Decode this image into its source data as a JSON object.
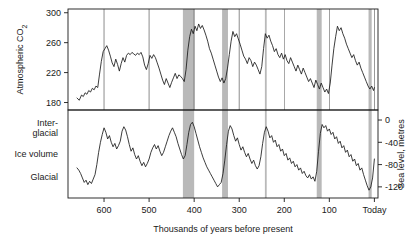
{
  "chart_data": {
    "type": "line",
    "title": "",
    "subtitle": "",
    "xlabel": "Thousands of years before present",
    "xlim": [
      680,
      -8
    ],
    "x_ticks": [
      600,
      500,
      400,
      300,
      200,
      100,
      0
    ],
    "x_tick_labels": [
      "600",
      "500",
      "400",
      "300",
      "200",
      "100",
      "Today"
    ],
    "grid": false,
    "legend": "none",
    "annotations": [
      {
        "label": "interglacial-band",
        "x_start": 425,
        "x_end": 400
      },
      {
        "label": "interglacial-band",
        "x_start": 338,
        "x_end": 325
      },
      {
        "label": "interglacial-band",
        "x_start": 243,
        "x_end": 239
      },
      {
        "label": "interglacial-band",
        "x_start": 128,
        "x_end": 117
      },
      {
        "label": "interglacial-band",
        "x_start": 13,
        "x_end": 6
      }
    ],
    "panels": [
      {
        "name": "co2-panel",
        "ylabel": "Atmospheric CO₂",
        "ylim": [
          170,
          305
        ],
        "y_ticks": [
          300,
          260,
          220,
          180
        ],
        "y_tick_labels": [
          "300",
          "260",
          "220",
          "180"
        ],
        "series": [
          {
            "name": "Atmospheric CO2",
            "color": "#1a1a1a",
            "x": [
              660,
              655,
              650,
              646,
              642,
              638,
              634,
              630,
              626,
              622,
              618,
              614,
              610,
              606,
              602,
              598,
              594,
              590,
              586,
              582,
              578,
              574,
              570,
              566,
              562,
              558,
              554,
              550,
              546,
              542,
              538,
              534,
              530,
              526,
              522,
              518,
              514,
              510,
              506,
              502,
              498,
              494,
              490,
              486,
              482,
              478,
              474,
              470,
              466,
              462,
              458,
              454,
              450,
              446,
              442,
              438,
              434,
              430,
              426,
              422,
              418,
              414,
              410,
              406,
              402,
              398,
              394,
              390,
              386,
              382,
              378,
              374,
              370,
              366,
              362,
              358,
              354,
              350,
              346,
              342,
              338,
              334,
              330,
              326,
              322,
              318,
              314,
              310,
              306,
              302,
              298,
              294,
              290,
              286,
              282,
              278,
              274,
              270,
              266,
              262,
              258,
              254,
              250,
              246,
              242,
              238,
              234,
              230,
              226,
              222,
              218,
              214,
              210,
              206,
              202,
              198,
              194,
              190,
              186,
              182,
              178,
              174,
              170,
              166,
              162,
              158,
              154,
              150,
              146,
              142,
              138,
              134,
              130,
              126,
              122,
              118,
              114,
              110,
              106,
              102,
              98,
              94,
              90,
              86,
              82,
              78,
              74,
              70,
              66,
              62,
              58,
              54,
              50,
              46,
              42,
              38,
              34,
              30,
              26,
              22,
              18,
              14,
              10,
              6,
              2,
              0
            ],
            "y": [
              186,
              183,
              190,
              188,
              193,
              191,
              196,
              194,
              199,
              197,
              202,
              200,
              218,
              235,
              248,
              252,
              256,
              250,
              242,
              233,
              228,
              238,
              231,
              222,
              232,
              240,
              234,
              243,
              246,
              244,
              247,
              245,
              243,
              246,
              244,
              247,
              241,
              230,
              224,
              232,
              243,
              239,
              244,
              240,
              233,
              226,
              218,
              210,
              204,
              212,
              206,
              200,
              207,
              213,
              219,
              212,
              217,
              215,
              212,
              208,
              224,
              250,
              268,
              278,
              272,
              282,
              276,
              285,
              279,
              283,
              277,
              270,
              262,
              252,
              246,
              238,
              230,
              222,
              214,
              208,
              213,
              206,
              212,
              226,
              244,
              262,
              275,
              268,
              272,
              265,
              258,
              250,
              242,
              238,
              232,
              240,
              236,
              228,
              234,
              230,
              224,
              218,
              228,
              252,
              272,
              266,
              270,
              262,
              256,
              248,
              252,
              244,
              240,
              246,
              238,
              244,
              236,
              232,
              240,
              234,
              228,
              222,
              230,
              224,
              218,
              226,
              220,
              214,
              208,
              212,
              206,
              200,
              210,
              204,
              198,
              206,
              200,
              194,
              198,
              192,
              206,
              230,
              252,
              268,
              282,
              276,
              280,
              272,
              266,
              258,
              252,
              246,
              240,
              244,
              236,
              230,
              234,
              226,
              220,
              214,
              208,
              202,
              198,
              202,
              196,
              200,
              194,
              198,
              192,
              188,
              196,
              214,
              240,
              262,
              275
            ]
          }
        ]
      },
      {
        "name": "ice-volume-panel",
        "ylabel": "Ice volume",
        "y_top_label": "Inter-\nglacial",
        "y_top_label_line1": "Inter-",
        "y_top_label_line2": "glacial",
        "y_bottom_label": "Glacial",
        "right_axis_label": "Sea level, metres",
        "right_y_ticks": [
          0,
          -40,
          -80,
          -120
        ],
        "right_y_tick_labels": [
          "0",
          "-40",
          "-80",
          "-120"
        ],
        "ylim": [
          -140,
          18
        ],
        "series": [
          {
            "name": "Ice volume / sea level",
            "color": "#1a1a1a",
            "x": [
              660,
              656,
              652,
              648,
              644,
              640,
              636,
              632,
              628,
              624,
              620,
              616,
              612,
              608,
              604,
              600,
              596,
              592,
              588,
              584,
              580,
              576,
              572,
              568,
              564,
              560,
              556,
              552,
              548,
              544,
              540,
              536,
              532,
              528,
              524,
              520,
              516,
              512,
              508,
              504,
              500,
              496,
              492,
              488,
              484,
              480,
              476,
              472,
              468,
              464,
              460,
              456,
              452,
              448,
              444,
              440,
              436,
              432,
              428,
              424,
              420,
              416,
              412,
              408,
              404,
              400,
              396,
              392,
              388,
              384,
              380,
              376,
              372,
              368,
              364,
              360,
              356,
              352,
              348,
              344,
              340,
              336,
              332,
              328,
              324,
              320,
              316,
              312,
              308,
              304,
              300,
              296,
              292,
              288,
              284,
              280,
              276,
              272,
              268,
              264,
              260,
              256,
              252,
              248,
              244,
              240,
              236,
              232,
              228,
              224,
              220,
              216,
              212,
              208,
              204,
              200,
              196,
              192,
              188,
              184,
              180,
              176,
              172,
              168,
              164,
              160,
              156,
              152,
              148,
              144,
              140,
              136,
              132,
              128,
              124,
              120,
              116,
              112,
              108,
              104,
              100,
              96,
              92,
              88,
              84,
              80,
              76,
              72,
              68,
              64,
              60,
              56,
              52,
              48,
              44,
              40,
              36,
              32,
              28,
              24,
              20,
              16,
              12,
              8,
              4,
              0
            ],
            "y": [
              -86,
              -90,
              -96,
              -104,
              -112,
              -108,
              -116,
              -110,
              -114,
              -106,
              -98,
              -80,
              -58,
              -40,
              -26,
              -14,
              -22,
              -34,
              -28,
              -40,
              -48,
              -42,
              -52,
              -46,
              -38,
              -20,
              -12,
              -18,
              -30,
              -44,
              -56,
              -50,
              -62,
              -70,
              -64,
              -74,
              -82,
              -76,
              -84,
              -78,
              -70,
              -58,
              -50,
              -44,
              -52,
              -46,
              -56,
              -64,
              -58,
              -48,
              -38,
              -28,
              -20,
              -14,
              -22,
              -30,
              -42,
              -52,
              -62,
              -70,
              -64,
              -44,
              -22,
              -8,
              -4,
              -12,
              -24,
              -36,
              -48,
              -58,
              -68,
              -76,
              -84,
              -90,
              -96,
              -102,
              -108,
              -114,
              -120,
              -116,
              -112,
              -96,
              -72,
              -44,
              -20,
              -10,
              -16,
              -28,
              -38,
              -32,
              -44,
              -54,
              -48,
              -58,
              -66,
              -60,
              -70,
              -78,
              -72,
              -82,
              -88,
              -82,
              -66,
              -42,
              -22,
              -12,
              -20,
              -32,
              -28,
              -40,
              -36,
              -48,
              -44,
              -56,
              -52,
              -64,
              -60,
              -72,
              -68,
              -78,
              -74,
              -84,
              -80,
              -90,
              -86,
              -96,
              -92,
              -100,
              -104,
              -98,
              -106,
              -102,
              -110,
              -92,
              -56,
              -24,
              -8,
              -14,
              -10,
              -20,
              -16,
              -26,
              -22,
              -34,
              -30,
              -42,
              -38,
              -50,
              -46,
              -58,
              -54,
              -66,
              -62,
              -74,
              -70,
              -82,
              -78,
              -90,
              -86,
              -98,
              -108,
              -118,
              -126,
              -120,
              -104,
              -70,
              -34,
              -8
            ]
          }
        ]
      }
    ]
  },
  "style": {
    "line_color": "#1a1a1a",
    "band_color": "#b9b9b9",
    "axis_color": "#1a1a1a",
    "background": "#ffffff"
  }
}
